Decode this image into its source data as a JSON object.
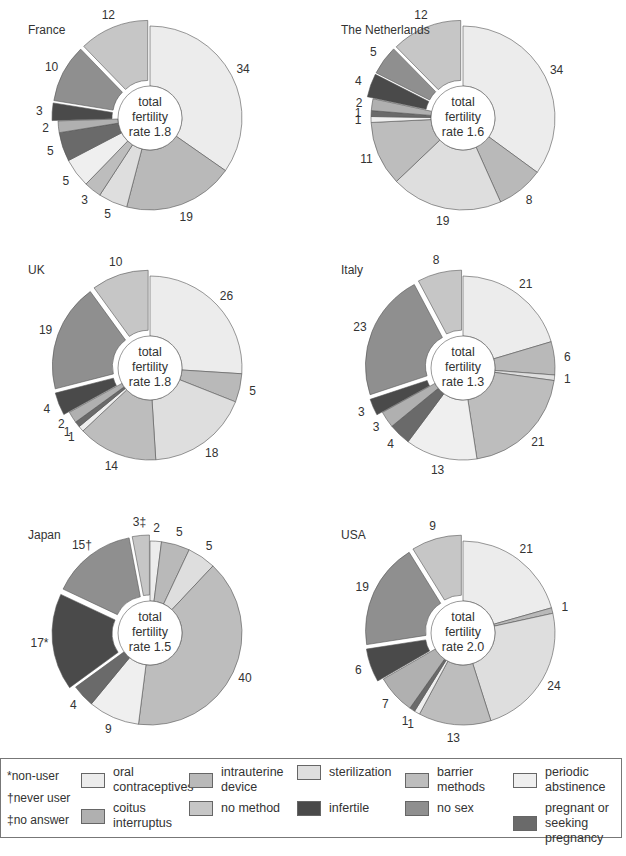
{
  "legend": {
    "notes": [
      "*non-user",
      "†never user",
      "‡no answer"
    ],
    "items": [
      {
        "key": "oral",
        "label_line1": "oral",
        "label_line2": "contraceptives",
        "color": "#ececec"
      },
      {
        "key": "iud",
        "label_line1": "intrauterine",
        "label_line2": "device",
        "color": "#b9b9b9"
      },
      {
        "key": "sterilization",
        "label_line1": "sterilization",
        "label_line2": "",
        "color": "#dedede"
      },
      {
        "key": "barrier",
        "label_line1": "barrier",
        "label_line2": "methods",
        "color": "#bdbdbd"
      },
      {
        "key": "periodic",
        "label_line1": "periodic",
        "label_line2": "abstinence",
        "color": "#efefef"
      },
      {
        "key": "coitus",
        "label_line1": "coitus",
        "label_line2": "interruptus",
        "color": "#b0b0b0"
      },
      {
        "key": "no_method",
        "label_line1": "no method",
        "label_line2": "",
        "color": "#c6c6c6"
      },
      {
        "key": "infertile",
        "label_line1": "infertile",
        "label_line2": "",
        "color": "#4a4a4a"
      },
      {
        "key": "no_sex",
        "label_line1": "no sex",
        "label_line2": "",
        "color": "#8f8f8f"
      },
      {
        "key": "pregnant",
        "label_line1": "pregnant or",
        "label_line2": "seeking pregnancy",
        "color": "#6a6a6a"
      }
    ]
  },
  "chart_data": [
    {
      "type": "pie",
      "title": "France",
      "center_text": [
        "total",
        "fertility",
        "rate 1.8"
      ],
      "total_fertility_rate": 1.8,
      "mapping_confidence": "values read directly; slice-to-category mapping inferred from order and shade, not confirmed",
      "slices": [
        {
          "category": "oral",
          "value": 34,
          "group": 1
        },
        {
          "category": "iud",
          "value": 19,
          "group": 1
        },
        {
          "category": "sterilization",
          "value": 5,
          "group": 1
        },
        {
          "category": "barrier",
          "value": 3,
          "group": 1
        },
        {
          "category": "periodic",
          "value": 5,
          "group": 1
        },
        {
          "category": "pregnant",
          "value": 5,
          "group": 1
        },
        {
          "category": "coitus",
          "value": 2,
          "group": 1
        },
        {
          "category": "infertile",
          "value": 3,
          "group": 2
        },
        {
          "category": "no_sex",
          "value": 10,
          "group": 2
        },
        {
          "category": "no_method",
          "value": 12,
          "group": 2
        }
      ]
    },
    {
      "type": "pie",
      "title": "The Netherlands",
      "center_text": [
        "total",
        "fertility",
        "rate 1.6"
      ],
      "total_fertility_rate": 1.6,
      "mapping_confidence": "values read directly; slice-to-category mapping inferred from order and shade, not confirmed",
      "slices": [
        {
          "category": "oral",
          "value": 34,
          "group": 1
        },
        {
          "category": "iud",
          "value": 8,
          "group": 1
        },
        {
          "category": "sterilization",
          "value": 19,
          "group": 1
        },
        {
          "category": "barrier",
          "value": 11,
          "group": 1
        },
        {
          "category": "periodic",
          "value": 1,
          "group": 1
        },
        {
          "category": "pregnant",
          "value": 1,
          "group": 1
        },
        {
          "category": "coitus",
          "value": 2,
          "group": 1
        },
        {
          "category": "infertile",
          "value": 4,
          "group": 2
        },
        {
          "category": "no_sex",
          "value": 5,
          "group": 2
        },
        {
          "category": "no_method",
          "value": 12,
          "group": 2
        }
      ]
    },
    {
      "type": "pie",
      "title": "UK",
      "center_text": [
        "total",
        "fertility",
        "rate 1.8"
      ],
      "total_fertility_rate": 1.8,
      "mapping_confidence": "values read directly; slice-to-category mapping inferred from order and shade, not confirmed",
      "slices": [
        {
          "category": "oral",
          "value": 26,
          "group": 1
        },
        {
          "category": "iud",
          "value": 5,
          "group": 1
        },
        {
          "category": "sterilization",
          "value": 18,
          "group": 1
        },
        {
          "category": "barrier",
          "value": 14,
          "group": 1
        },
        {
          "category": "periodic",
          "value": 1,
          "group": 1
        },
        {
          "category": "pregnant",
          "value": 1,
          "group": 1
        },
        {
          "category": "coitus",
          "value": 2,
          "group": 1
        },
        {
          "category": "infertile",
          "value": 4,
          "group": 2
        },
        {
          "category": "no_sex",
          "value": 19,
          "group": 2
        },
        {
          "category": "no_method",
          "value": 10,
          "group": 2
        }
      ]
    },
    {
      "type": "pie",
      "title": "Italy",
      "center_text": [
        "total",
        "fertility",
        "rate 1.3"
      ],
      "total_fertility_rate": 1.3,
      "mapping_confidence": "values read directly; slice-to-category mapping inferred from order and shade, not confirmed",
      "slices": [
        {
          "category": "oral",
          "value": 21,
          "group": 1
        },
        {
          "category": "iud",
          "value": 6,
          "group": 1
        },
        {
          "category": "sterilization",
          "value": 1,
          "group": 1
        },
        {
          "category": "barrier",
          "value": 21,
          "group": 1
        },
        {
          "category": "periodic",
          "value": 13,
          "group": 1
        },
        {
          "category": "pregnant",
          "value": 4,
          "group": 1
        },
        {
          "category": "coitus",
          "value": 3,
          "group": 1
        },
        {
          "category": "infertile",
          "value": 3,
          "group": 2
        },
        {
          "category": "no_sex",
          "value": 23,
          "group": 2
        },
        {
          "category": "no_method",
          "value": 8,
          "group": 2
        }
      ]
    },
    {
      "type": "pie",
      "title": "Japan",
      "center_text": [
        "total",
        "fertility",
        "rate 1.5"
      ],
      "total_fertility_rate": 1.5,
      "mapping_confidence": "values read directly; slice-to-category mapping inferred from order and shade, not confirmed",
      "slices": [
        {
          "category": "oral",
          "value": 2,
          "group": 1
        },
        {
          "category": "iud",
          "value": 5,
          "group": 1
        },
        {
          "category": "sterilization",
          "value": 5,
          "group": 1
        },
        {
          "category": "barrier",
          "value": 40,
          "group": 1
        },
        {
          "category": "periodic",
          "value": 9,
          "group": 1
        },
        {
          "category": "pregnant",
          "value": 4,
          "group": 1
        },
        {
          "category": "infertile",
          "value": 17,
          "group": 2,
          "label_suffix": "*"
        },
        {
          "category": "no_sex",
          "value": 15,
          "group": 2,
          "label_suffix": "†"
        },
        {
          "category": "no_method",
          "value": 3,
          "group": 2,
          "label_suffix": "‡"
        }
      ]
    },
    {
      "type": "pie",
      "title": "USA",
      "center_text": [
        "total",
        "fertility",
        "rate 2.0"
      ],
      "total_fertility_rate": 2.0,
      "mapping_confidence": "values read directly; slice-to-category mapping inferred from order and shade, not confirmed",
      "slices": [
        {
          "category": "oral",
          "value": 21,
          "group": 1
        },
        {
          "category": "iud",
          "value": 1,
          "group": 1
        },
        {
          "category": "sterilization",
          "value": 24,
          "group": 1
        },
        {
          "category": "barrier",
          "value": 13,
          "group": 1
        },
        {
          "category": "periodic",
          "value": 1,
          "group": 1
        },
        {
          "category": "pregnant",
          "value": 1,
          "group": 1
        },
        {
          "category": "coitus",
          "value": 7,
          "group": 1
        },
        {
          "category": "infertile",
          "value": 6,
          "group": 2
        },
        {
          "category": "no_sex",
          "value": 19,
          "group": 2
        },
        {
          "category": "no_method",
          "value": 9,
          "group": 2
        }
      ]
    }
  ]
}
